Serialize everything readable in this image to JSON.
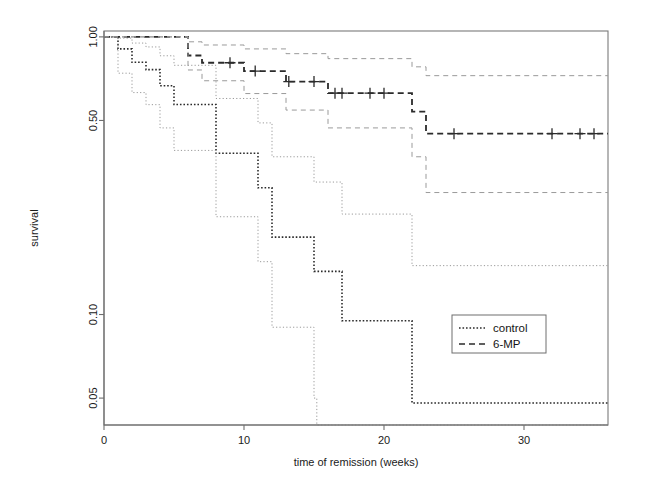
{
  "figure": {
    "kind": "kaplan-meier-survival-plot",
    "background_color": "#ffffff",
    "frame_color": "#7a7a7a"
  },
  "axes": {
    "x": {
      "label": "time of remission (weeks)",
      "ticks": [
        0,
        10,
        20,
        30
      ],
      "tick_labels": [
        "0",
        "10",
        "20",
        "30"
      ],
      "range": [
        0,
        36
      ],
      "pixel_left": 104,
      "pixel_right": 608
    },
    "y": {
      "label": "survival",
      "scale": "log",
      "ticks": [
        1.0,
        0.5,
        0.1,
        0.05
      ],
      "tick_labels": [
        "1.00",
        "0.50",
        "0.10",
        "0.05"
      ],
      "range": [
        0.04,
        1.05
      ],
      "pixel_top": 31,
      "pixel_bottom": 425
    }
  },
  "legend": {
    "position": "bottom-right-inside",
    "box": {
      "x": 452,
      "y": 315,
      "width": 94,
      "height": 38
    },
    "entries": [
      {
        "label": "control",
        "style": "dotted",
        "color": "#2b2b2b"
      },
      {
        "label": "6-MP",
        "style": "dashed",
        "color": "#2b2b2b"
      }
    ]
  },
  "chart_data": {
    "type": "line",
    "title": "",
    "xlabel": "time of remission (weeks)",
    "ylabel": "survival",
    "xlim": [
      0,
      36
    ],
    "ylim": [
      0.04,
      1.05
    ],
    "yscale": "log",
    "grid": false,
    "legend_position": "lower right",
    "series": [
      {
        "name": "control",
        "style": "dotted",
        "color": "#2b2b2b",
        "linewidth": 1.6,
        "steps": [
          {
            "t": 0,
            "s": 1.0
          },
          {
            "t": 1,
            "s": 0.905
          },
          {
            "t": 2,
            "s": 0.81
          },
          {
            "t": 3,
            "s": 0.762
          },
          {
            "t": 4,
            "s": 0.667
          },
          {
            "t": 5,
            "s": 0.571
          },
          {
            "t": 8,
            "s": 0.381
          },
          {
            "t": 11,
            "s": 0.286
          },
          {
            "t": 12,
            "s": 0.19
          },
          {
            "t": 15,
            "s": 0.143
          },
          {
            "t": 17,
            "s": 0.095
          },
          {
            "t": 22,
            "s": 0.048
          },
          {
            "t": 23,
            "s": 0.048
          }
        ],
        "censored": []
      },
      {
        "name": "control-upper-ci",
        "style": "dotted",
        "color": "#9a9a9a",
        "linewidth": 1.0,
        "steps": [
          {
            "t": 0,
            "s": 1.0
          },
          {
            "t": 1,
            "s": 0.99
          },
          {
            "t": 2,
            "s": 0.95
          },
          {
            "t": 3,
            "s": 0.92
          },
          {
            "t": 4,
            "s": 0.855
          },
          {
            "t": 5,
            "s": 0.79
          },
          {
            "t": 8,
            "s": 0.6
          },
          {
            "t": 11,
            "s": 0.49
          },
          {
            "t": 12,
            "s": 0.37
          },
          {
            "t": 15,
            "s": 0.3
          },
          {
            "t": 17,
            "s": 0.23
          },
          {
            "t": 22,
            "s": 0.15
          },
          {
            "t": 23,
            "s": 0.15
          }
        ],
        "censored": []
      },
      {
        "name": "control-lower-ci",
        "style": "dotted",
        "color": "#9a9a9a",
        "linewidth": 1.0,
        "steps": [
          {
            "t": 0,
            "s": 1.0
          },
          {
            "t": 1,
            "s": 0.74
          },
          {
            "t": 2,
            "s": 0.63
          },
          {
            "t": 3,
            "s": 0.57
          },
          {
            "t": 4,
            "s": 0.47
          },
          {
            "t": 5,
            "s": 0.39
          },
          {
            "t": 8,
            "s": 0.225
          },
          {
            "t": 11,
            "s": 0.155
          },
          {
            "t": 12,
            "s": 0.09
          },
          {
            "t": 15,
            "s": 0.05
          },
          {
            "t": 15.2,
            "s": 0.04
          }
        ],
        "censored": []
      },
      {
        "name": "6-MP",
        "style": "dashed",
        "color": "#2b2b2b",
        "linewidth": 1.8,
        "steps": [
          {
            "t": 0,
            "s": 1.0
          },
          {
            "t": 6,
            "s": 0.857
          },
          {
            "t": 7,
            "s": 0.807
          },
          {
            "t": 10,
            "s": 0.753
          },
          {
            "t": 13,
            "s": 0.69
          },
          {
            "t": 16,
            "s": 0.627
          },
          {
            "t": 22,
            "s": 0.538
          },
          {
            "t": 23,
            "s": 0.448
          },
          {
            "t": 36,
            "s": 0.448
          }
        ],
        "censored": [
          9,
          10.8,
          13.2,
          15,
          16.5,
          17,
          19,
          20,
          25,
          32,
          34,
          35
        ]
      },
      {
        "name": "6-MP-upper-ci",
        "style": "dashed",
        "color": "#9a9a9a",
        "linewidth": 1.0,
        "steps": [
          {
            "t": 0,
            "s": 1.0
          },
          {
            "t": 6,
            "s": 0.96
          },
          {
            "t": 7,
            "s": 0.935
          },
          {
            "t": 10,
            "s": 0.905
          },
          {
            "t": 13,
            "s": 0.87
          },
          {
            "t": 16,
            "s": 0.835
          },
          {
            "t": 22,
            "s": 0.78
          },
          {
            "t": 23,
            "s": 0.725
          },
          {
            "t": 36,
            "s": 0.725
          }
        ],
        "censored": []
      },
      {
        "name": "6-MP-lower-ci",
        "style": "dashed",
        "color": "#9a9a9a",
        "linewidth": 1.0,
        "steps": [
          {
            "t": 0,
            "s": 1.0
          },
          {
            "t": 6,
            "s": 0.76
          },
          {
            "t": 7,
            "s": 0.695
          },
          {
            "t": 10,
            "s": 0.625
          },
          {
            "t": 13,
            "s": 0.545
          },
          {
            "t": 16,
            "s": 0.47
          },
          {
            "t": 22,
            "s": 0.37
          },
          {
            "t": 23,
            "s": 0.275
          },
          {
            "t": 36,
            "s": 0.275
          }
        ],
        "censored": []
      }
    ]
  }
}
